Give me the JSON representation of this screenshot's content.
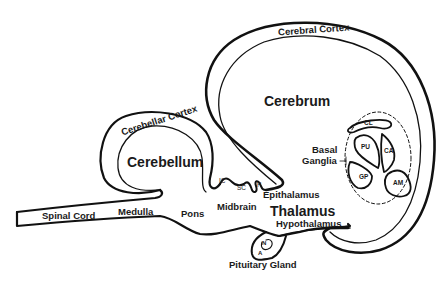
{
  "diagram": {
    "type": "brain-anatomy-sagittal-schematic",
    "stroke_color": "#111111",
    "background": "#ffffff"
  },
  "labels": {
    "cerebral_cortex": "Cerebral Cortex",
    "cerebrum": "Cerebrum",
    "cerebellar_cortex": "Cerebellar Cortex",
    "cerebellum": "Cerebellum",
    "basal_ganglia_line1": "Basal",
    "basal_ganglia_line2": "Ganglia",
    "cl": "CL",
    "pu": "PU",
    "ca": "CA",
    "gp": "GP",
    "am": "AM",
    "ic": "IC",
    "sc": "SC",
    "p": "P",
    "epithalamus": "Epithalamus",
    "thalamus": "Thalamus",
    "hypothalamus": "Hypothalamus",
    "midbrain": "Midbrain",
    "pons": "Pons",
    "medulla": "Medulla",
    "spinal_cord": "Spinal Cord",
    "n": "N",
    "a": "A",
    "pituitary_gland": "Pituitary Gland"
  }
}
